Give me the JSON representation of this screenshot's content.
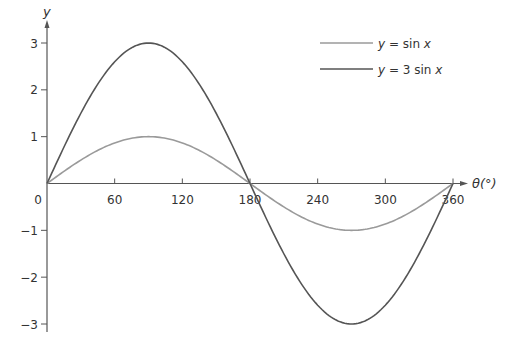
{
  "chart_data": {
    "type": "line",
    "title": "",
    "xlabel": "θ(°)",
    "ylabel": "y",
    "xlim": [
      0,
      360
    ],
    "ylim": [
      -3,
      3
    ],
    "x_ticks": [
      0,
      60,
      120,
      180,
      240,
      300,
      360
    ],
    "x_tick_labels": [
      "0",
      "60",
      "120",
      "180",
      "240",
      "300",
      "360"
    ],
    "y_ticks": [
      3,
      2,
      1,
      -1,
      -2,
      -3
    ],
    "y_tick_labels": [
      "3",
      "2",
      "1",
      "−1",
      "−2",
      "−3"
    ],
    "grid": false,
    "legend_position": "top-right",
    "x": [
      0,
      30,
      60,
      90,
      120,
      150,
      180,
      210,
      240,
      270,
      300,
      330,
      360
    ],
    "series": [
      {
        "name": "y = sin x",
        "label_parts": [
          "y",
          " = sin ",
          "x"
        ],
        "color": "#9a9a9a",
        "amplitude": 1,
        "values": [
          0,
          0.5,
          0.866,
          1,
          0.866,
          0.5,
          0,
          -0.5,
          -0.866,
          -1,
          -0.866,
          -0.5,
          0
        ]
      },
      {
        "name": "y = 3 sin x",
        "label_parts": [
          "y",
          " = 3 sin ",
          "x"
        ],
        "color": "#555555",
        "amplitude": 3,
        "values": [
          0,
          1.5,
          2.598,
          3,
          2.598,
          1.5,
          0,
          -1.5,
          -2.598,
          -3,
          -2.598,
          -1.5,
          0
        ]
      }
    ]
  },
  "colors": {
    "axis": "#555555",
    "text": "#333333"
  }
}
